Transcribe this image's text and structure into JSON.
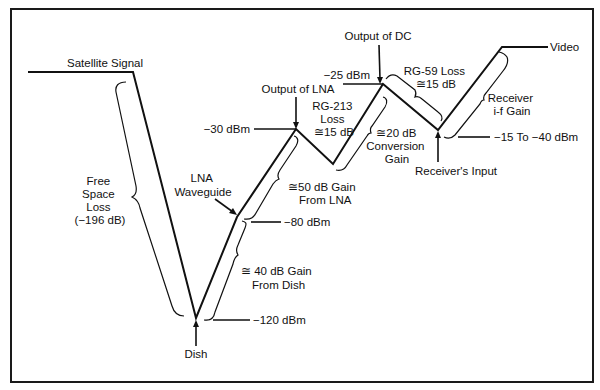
{
  "diagram": {
    "colors": {
      "line": "#111111",
      "background": "#ffffff",
      "frame": "#1a1a1a"
    },
    "labels": {
      "satellite_signal": "Satellite Signal",
      "free_space_loss": [
        "Free",
        "Space",
        "Loss",
        "(−196 dB)"
      ],
      "dish": "Dish",
      "dish_level": "−120 dBm",
      "dish_gain": [
        "≅ 40 dB Gain",
        "From Dish"
      ],
      "lna_waveguide": [
        "LNA",
        "Waveguide"
      ],
      "lna_input_level": "−80 dBm",
      "lna_gain": [
        "≅50 dB Gain",
        "From LNA"
      ],
      "output_of_lna": "Output of LNA",
      "lna_output_level": "−30 dBm",
      "rg213_loss": [
        "RG-213",
        "Loss",
        "≅15 dB"
      ],
      "conversion_gain": [
        "≅20 dB",
        "Conversion",
        "Gain"
      ],
      "output_of_dc": "Output of DC",
      "dc_output_level": "−25 dBm",
      "rg59_loss": [
        "RG-59 Loss",
        "≅15 dB"
      ],
      "receivers_input": "Receiver's Input",
      "receiver_input_level": "−15 To −40 dBm",
      "receiver_if_gain": [
        "Receiver",
        "i-f Gain"
      ],
      "video": "Video"
    },
    "stages": [
      {
        "name": "Satellite Signal"
      },
      {
        "name": "Free Space Loss",
        "value_db": -196
      },
      {
        "name": "Dish",
        "level_dbm": -120
      },
      {
        "name": "Gain From Dish",
        "value_db": 40
      },
      {
        "name": "LNA Waveguide",
        "level_dbm": -80
      },
      {
        "name": "Gain From LNA",
        "value_db": 50
      },
      {
        "name": "Output of LNA",
        "level_dbm": -30
      },
      {
        "name": "RG-213 Loss",
        "value_db": -15
      },
      {
        "name": "Conversion Gain",
        "value_db": 20
      },
      {
        "name": "Output of DC",
        "level_dbm": -25
      },
      {
        "name": "RG-59 Loss",
        "value_db": -15
      },
      {
        "name": "Receiver's Input",
        "level_dbm": "-15 To -40"
      },
      {
        "name": "Receiver i-f Gain"
      },
      {
        "name": "Video"
      }
    ]
  }
}
